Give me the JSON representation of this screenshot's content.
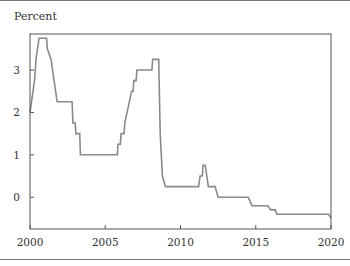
{
  "chart_data": {
    "type": "line",
    "title": "",
    "xlabel": "",
    "ylabel": "Percent",
    "xlim": [
      2000,
      2020
    ],
    "ylim": [
      -0.75,
      3.85
    ],
    "x_ticks": [
      2000,
      2005,
      2010,
      2015,
      2020
    ],
    "x_tick_labels": [
      "2000",
      "2005",
      "2010",
      "2015",
      "2020"
    ],
    "y_ticks": [
      0,
      1,
      2,
      3
    ],
    "y_tick_labels": [
      "0",
      "1",
      "2",
      "3"
    ],
    "grid": false,
    "legend": null,
    "line_color": "#8a8a8a",
    "series": [
      {
        "name": "Policy rate",
        "step": true,
        "points": [
          [
            2000.0,
            2.0
          ],
          [
            2000.1,
            2.25
          ],
          [
            2000.2,
            2.5
          ],
          [
            2000.3,
            2.75
          ],
          [
            2000.35,
            3.0
          ],
          [
            2000.4,
            3.25
          ],
          [
            2000.5,
            3.5
          ],
          [
            2000.6,
            3.75
          ],
          [
            2001.1,
            3.75
          ],
          [
            2001.15,
            3.5
          ],
          [
            2001.4,
            3.25
          ],
          [
            2001.6,
            2.75
          ],
          [
            2001.7,
            2.5
          ],
          [
            2001.8,
            2.25
          ],
          [
            2002.8,
            2.25
          ],
          [
            2002.85,
            1.75
          ],
          [
            2003.0,
            1.75
          ],
          [
            2003.05,
            1.5
          ],
          [
            2003.3,
            1.5
          ],
          [
            2003.35,
            1.0
          ],
          [
            2005.8,
            1.0
          ],
          [
            2005.85,
            1.25
          ],
          [
            2006.0,
            1.25
          ],
          [
            2006.05,
            1.5
          ],
          [
            2006.25,
            1.5
          ],
          [
            2006.3,
            1.75
          ],
          [
            2006.45,
            2.0
          ],
          [
            2006.6,
            2.25
          ],
          [
            2006.75,
            2.5
          ],
          [
            2006.85,
            2.5
          ],
          [
            2006.9,
            2.75
          ],
          [
            2007.05,
            2.75
          ],
          [
            2007.1,
            3.0
          ],
          [
            2008.1,
            3.0
          ],
          [
            2008.15,
            3.25
          ],
          [
            2008.55,
            3.25
          ],
          [
            2008.65,
            1.5
          ],
          [
            2008.8,
            0.5
          ],
          [
            2009.0,
            0.25
          ],
          [
            2011.2,
            0.25
          ],
          [
            2011.3,
            0.5
          ],
          [
            2011.45,
            0.5
          ],
          [
            2011.5,
            0.75
          ],
          [
            2011.65,
            0.75
          ],
          [
            2011.75,
            0.5
          ],
          [
            2011.85,
            0.25
          ],
          [
            2012.3,
            0.25
          ],
          [
            2012.5,
            0.0
          ],
          [
            2014.5,
            0.0
          ],
          [
            2014.75,
            -0.2
          ],
          [
            2015.8,
            -0.2
          ],
          [
            2016.0,
            -0.3
          ],
          [
            2016.3,
            -0.3
          ],
          [
            2016.4,
            -0.4
          ],
          [
            2019.85,
            -0.4
          ],
          [
            2020.0,
            -0.5
          ]
        ]
      }
    ]
  },
  "axis": {
    "y_title": "Percent"
  }
}
